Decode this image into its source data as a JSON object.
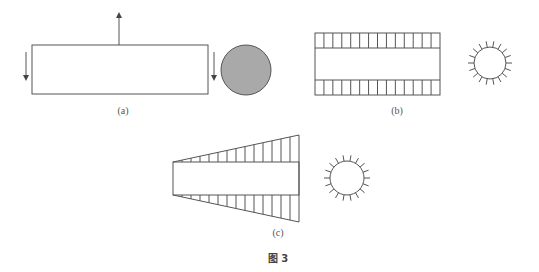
{
  "figure": {
    "caption": "图 3",
    "panels": [
      {
        "id": "a",
        "label": "(a)",
        "description": "rectangle with downward arrows on both sides, upward arrow from top center; solid gray filled circle cross-section"
      },
      {
        "id": "b",
        "label": "(b)",
        "description": "rectangle with uniform hatched bands top and bottom; circle with radial ticks cross-section"
      },
      {
        "id": "c",
        "label": "(c)",
        "description": "rectangle with linearly increasing hatched triangular bands top and bottom; circle with radial ticks cross-section"
      }
    ]
  },
  "colors": {
    "stroke": "#555555",
    "fill_circle_a": "#a9a9a9"
  }
}
